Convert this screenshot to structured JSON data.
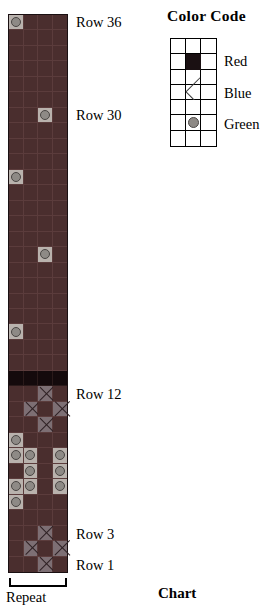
{
  "chart_data": {
    "type": "table",
    "title": "Chart",
    "columns": 4,
    "rows": 36,
    "background_color": "#4a2e2e",
    "symbols": {
      "red": "solid dark square",
      "blue": "X",
      "green": "circle"
    },
    "colors": {
      "red": "#140a0c",
      "blue": "#7d6f74",
      "green": "#b9b2ad",
      "background": "#4a2e2e"
    },
    "cells": [
      {
        "row": 36,
        "col": 1,
        "value": "green"
      },
      {
        "row": 30,
        "col": 3,
        "value": "green"
      },
      {
        "row": 26,
        "col": 1,
        "value": "green"
      },
      {
        "row": 21,
        "col": 3,
        "value": "green"
      },
      {
        "row": 16,
        "col": 1,
        "value": "green"
      },
      {
        "row": 13,
        "col": 1,
        "value": "red"
      },
      {
        "row": 13,
        "col": 2,
        "value": "red"
      },
      {
        "row": 13,
        "col": 3,
        "value": "red"
      },
      {
        "row": 13,
        "col": 4,
        "value": "red"
      },
      {
        "row": 12,
        "col": 3,
        "value": "blue"
      },
      {
        "row": 11,
        "col": 2,
        "value": "blue"
      },
      {
        "row": 11,
        "col": 4,
        "value": "blue"
      },
      {
        "row": 10,
        "col": 3,
        "value": "blue"
      },
      {
        "row": 9,
        "col": 1,
        "value": "green"
      },
      {
        "row": 8,
        "col": 1,
        "value": "green"
      },
      {
        "row": 8,
        "col": 2,
        "value": "green"
      },
      {
        "row": 8,
        "col": 4,
        "value": "green"
      },
      {
        "row": 7,
        "col": 2,
        "value": "green"
      },
      {
        "row": 7,
        "col": 4,
        "value": "green"
      },
      {
        "row": 6,
        "col": 1,
        "value": "green"
      },
      {
        "row": 6,
        "col": 2,
        "value": "green"
      },
      {
        "row": 6,
        "col": 4,
        "value": "green"
      },
      {
        "row": 5,
        "col": 1,
        "value": "green"
      },
      {
        "row": 3,
        "col": 3,
        "value": "blue"
      },
      {
        "row": 2,
        "col": 2,
        "value": "blue"
      },
      {
        "row": 2,
        "col": 4,
        "value": "blue"
      },
      {
        "row": 1,
        "col": 3,
        "value": "blue"
      }
    ]
  },
  "chart": {
    "caption": "Chart",
    "row_labels": [
      {
        "text": "Row 36",
        "row": 36
      },
      {
        "text": "Row 30",
        "row": 30
      },
      {
        "text": "Row 12",
        "row": 12
      },
      {
        "text": "Row 3",
        "row": 3
      },
      {
        "text": "Row 1",
        "row": 1
      }
    ],
    "repeat_label": "Repeat"
  },
  "legend": {
    "title": "Color Code",
    "grid_rows": 7,
    "grid_cols": 3,
    "entries": [
      {
        "label": "Red",
        "symbol": "solid-square",
        "swatch_row": 2,
        "color": "#140a0c"
      },
      {
        "label": "Blue",
        "symbol": "x-mark",
        "swatch_row": 4,
        "color": "#7d6f74"
      },
      {
        "label": "Green",
        "symbol": "circle",
        "swatch_row": 6,
        "color": "#b9b2ad"
      }
    ]
  }
}
